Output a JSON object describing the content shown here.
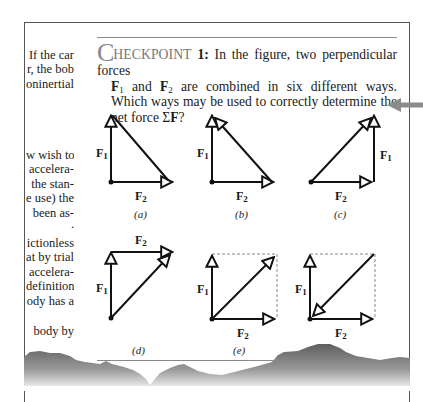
{
  "left_column": {
    "lines_top": [
      "If the car",
      "r, the bob",
      "oninertial"
    ],
    "lines_middle": [
      "w wish to",
      "accelera-",
      "the stan-",
      "e use) the",
      "been as-",
      "."
    ],
    "lines_lower": [
      "ictionless",
      "at by trial",
      "accelera-",
      "definition,",
      "ody has a"
    ],
    "line_bottom": "body by"
  },
  "checkpoint": {
    "initial": "C",
    "heading_rest": "HECKPOINT",
    "number": "1:",
    "text_1": " In the figure, two perpendicular forces",
    "f1": "F",
    "f1_sub": "1",
    "text_2": " and ",
    "f2": "F",
    "f2_sub": "2",
    "text_3": " are combined in six different ways. Which ways may be used to correctly determine the net force ",
    "sigma": "Σ",
    "net_f": "F",
    "end": "?"
  },
  "figures": [
    {
      "id": "a",
      "caption": "(a)",
      "f1_label": "F1",
      "f2_label": "F2"
    },
    {
      "id": "b",
      "caption": "(b)",
      "f1_label": "F1",
      "f2_label": "F2"
    },
    {
      "id": "c",
      "caption": "(c)",
      "f1_label": "F1",
      "f2_label": "F2"
    },
    {
      "id": "d",
      "caption": "(d)",
      "f1_label": "F1",
      "f2_label": "F2"
    },
    {
      "id": "e",
      "caption": "(e)",
      "f1_label": "F1",
      "f2_label": "F2"
    },
    {
      "id": "f",
      "caption": "",
      "f1_label": "F1",
      "f2_label": "F2"
    }
  ],
  "labels": {
    "F": "F",
    "sub1": "1",
    "sub2": "2"
  },
  "colors": {
    "text": "#1a1a1a",
    "rule": "#8a8a8a",
    "pointer_arrow": "#8c8c8c",
    "mountain": "#6e6e6e"
  }
}
